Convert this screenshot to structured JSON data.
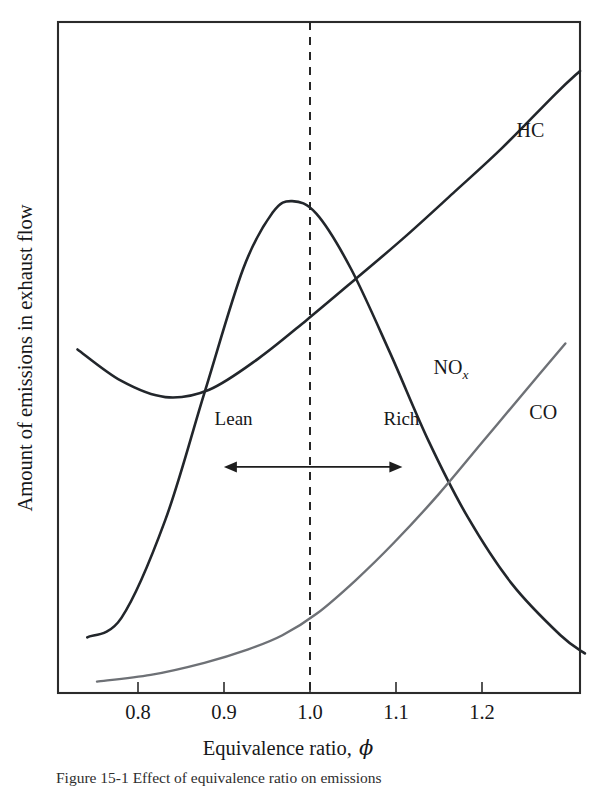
{
  "figure": {
    "caption_partial": "Figure  15-1    Effect of equivalence ratio on emissions"
  },
  "chart_data": {
    "type": "line",
    "title": "",
    "xlabel": "Equivalence ratio,",
    "xlabel_symbol": "ϕ",
    "ylabel": "Amount of emissions in exhaust flow",
    "xlim": [
      0.735,
      1.27
    ],
    "ylim": [
      0,
      1
    ],
    "xticks": [
      0.8,
      0.9,
      1.0,
      1.1,
      1.2
    ],
    "xtick_labels": [
      "0.8",
      "0.9",
      "1.0",
      "1.1",
      "1.2"
    ],
    "yticks": [],
    "ytick_labels": [],
    "grid": false,
    "legend_position": "inline-curve-labels",
    "annotations": [
      {
        "name": "stoichiometric-line",
        "type": "vline",
        "x": 1.0,
        "style": "dashed"
      },
      {
        "name": "lean-label",
        "type": "text",
        "text": "Lean",
        "x": 0.915,
        "y": 0.4
      },
      {
        "name": "rich-label",
        "type": "text",
        "text": "Rich",
        "x": 1.087,
        "y": 0.4
      },
      {
        "name": "lean-rich-arrow",
        "type": "double-arrow",
        "x_start": 0.905,
        "x_end": 1.088,
        "y": 0.337
      }
    ],
    "series": [
      {
        "name": "HC",
        "label": "HC",
        "color": "#22262b",
        "label_x": 1.205,
        "label_y": 0.828,
        "x": [
          0.755,
          0.8,
          0.845,
          0.89,
          0.94,
          0.99,
          1.04,
          1.09,
          1.14,
          1.19,
          1.245,
          1.27
        ],
        "y": [
          0.512,
          0.465,
          0.441,
          0.452,
          0.498,
          0.556,
          0.617,
          0.679,
          0.745,
          0.812,
          0.893,
          0.927
        ]
      },
      {
        "name": "NOx",
        "label": "NO",
        "label_sub": "x",
        "color": "#22262b",
        "label_x": 1.12,
        "label_y": 0.476,
        "x": [
          0.765,
          0.8,
          0.845,
          0.885,
          0.925,
          0.955,
          0.975,
          1.0,
          1.035,
          1.075,
          1.115,
          1.155,
          1.2,
          1.25,
          1.275
        ],
        "y": [
          0.083,
          0.112,
          0.258,
          0.447,
          0.633,
          0.716,
          0.733,
          0.714,
          0.633,
          0.508,
          0.375,
          0.262,
          0.163,
          0.086,
          0.059
        ]
      },
      {
        "name": "CO",
        "label": "CO",
        "color": "#6e7176",
        "label_x": 1.218,
        "label_y": 0.408,
        "x": [
          0.775,
          0.83,
          0.885,
          0.93,
          0.965,
          1.0,
          1.04,
          1.08,
          1.125,
          1.17,
          1.215,
          1.255
        ],
        "y": [
          0.017,
          0.027,
          0.045,
          0.065,
          0.086,
          0.118,
          0.168,
          0.225,
          0.296,
          0.374,
          0.452,
          0.521
        ]
      }
    ]
  }
}
